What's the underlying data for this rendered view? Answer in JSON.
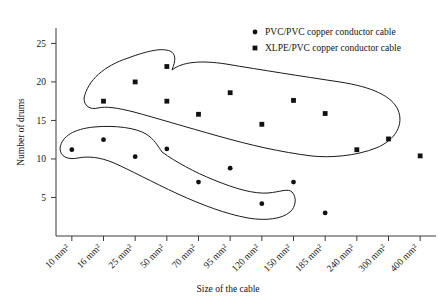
{
  "chart_data": {
    "type": "scatter",
    "title": "",
    "xlabel": "Size of the cable",
    "ylabel": "Number of drums",
    "categories": [
      "10 mm²",
      "16 mm²",
      "25 mm²",
      "50 mm²",
      "70 mm²",
      "95 mm²",
      "120 mm²",
      "150 mm²",
      "185 mm²",
      "240 mm²",
      "300 mm²",
      "400 mm²"
    ],
    "ylim": [
      0,
      27
    ],
    "yticks": [
      5,
      10,
      15,
      20,
      25
    ],
    "ytick_labels": [
      "5",
      "10",
      "15",
      "20",
      "25"
    ],
    "grid": false,
    "legend_position": "top-right",
    "series": [
      {
        "name": "PVC/PVC copper conductor cable",
        "marker": "circle",
        "color": "#111111",
        "points": [
          {
            "x": "10 mm²",
            "y": 11.2
          },
          {
            "x": "16 mm²",
            "y": 12.5
          },
          {
            "x": "25 mm²",
            "y": 10.3
          },
          {
            "x": "50 mm²",
            "y": 11.3
          },
          {
            "x": "70 mm²",
            "y": 7.0
          },
          {
            "x": "95 mm²",
            "y": 8.8
          },
          {
            "x": "120 mm²",
            "y": 4.2
          },
          {
            "x": "150 mm²",
            "y": 7.0
          },
          {
            "x": "185 mm²",
            "y": 3.0
          }
        ]
      },
      {
        "name": "XLPE/PVC copper conductor cable",
        "marker": "square",
        "color": "#111111",
        "points": [
          {
            "x": "16 mm²",
            "y": 17.5
          },
          {
            "x": "25 mm²",
            "y": 20.0
          },
          {
            "x": "50 mm²",
            "y": 22.0
          },
          {
            "x": "50 mm²",
            "y": 17.5
          },
          {
            "x": "70 mm²",
            "y": 15.8
          },
          {
            "x": "95 mm²",
            "y": 18.6
          },
          {
            "x": "120 mm²",
            "y": 14.5
          },
          {
            "x": "150 mm²",
            "y": 17.6
          },
          {
            "x": "185 mm²",
            "y": 15.9
          },
          {
            "x": "240 mm²",
            "y": 11.2
          },
          {
            "x": "300 mm²",
            "y": 12.6
          },
          {
            "x": "400 mm²",
            "y": 10.4
          }
        ]
      }
    ],
    "annotations": [
      {
        "name": "xlpe-cluster-outline",
        "description": "hand-drawn enclosing curve around XLPE/PVC points"
      },
      {
        "name": "pvc-cluster-outline",
        "description": "hand-drawn enclosing curve around PVC/PVC points"
      }
    ]
  },
  "legend": {
    "entries": [
      {
        "label": "PVC/PVC copper conductor cable",
        "marker": "circle"
      },
      {
        "label": "XLPE/PVC copper conductor cable",
        "marker": "square"
      }
    ]
  },
  "axes": {
    "y_title": "Number of drums",
    "x_title": "Size of the cable"
  }
}
